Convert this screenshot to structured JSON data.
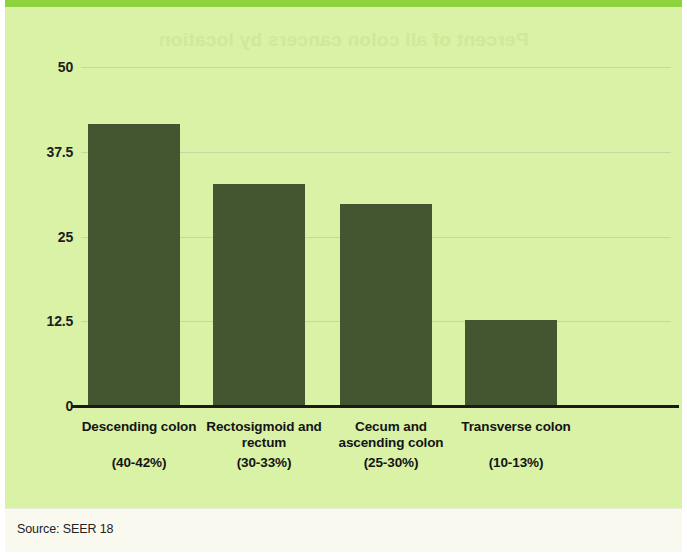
{
  "figure": {
    "background_color": "#d9f2a5",
    "accent_color": "#8ed33d",
    "bar_color": "#44562f",
    "ghost_title": "Percent of all colon cancers by location"
  },
  "footer": {
    "source_label": "Source: SEER 18"
  },
  "chart_data": {
    "type": "bar",
    "title": "",
    "xlabel": "",
    "ylabel": "",
    "ylim": [
      0,
      50
    ],
    "grid": true,
    "legend": "none",
    "ytick_labels": [
      "50",
      "37.5",
      "25",
      "12.5",
      "0"
    ],
    "ytick_values": [
      50,
      37.5,
      25,
      12.5,
      0
    ],
    "categories": [
      "Descending colon",
      "Rectosigmoid and rectum",
      "Cecum and ascending colon",
      "Transverse colon"
    ],
    "category_lines": [
      [
        "Descending colon"
      ],
      [
        "Rectosigmoid and",
        "rectum"
      ],
      [
        "Cecum and",
        "ascending colon"
      ],
      [
        "Transverse colon"
      ]
    ],
    "category_ranges": [
      "(40-42%)",
      "(30-33%)",
      "(25-30%)",
      "(10-13%)"
    ],
    "values": [
      41.6,
      32.7,
      29.8,
      12.7
    ]
  }
}
